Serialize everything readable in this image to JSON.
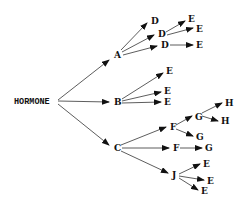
{
  "diagram": {
    "type": "tree",
    "colors": {
      "line": "#333333",
      "text": "#111111",
      "background": "#ffffff"
    },
    "nodes": [
      {
        "id": "hormone",
        "label": "HORMONE",
        "x": 14,
        "y": 104
      },
      {
        "id": "a",
        "label": "A",
        "x": 114,
        "y": 58
      },
      {
        "id": "b",
        "label": "B",
        "x": 114,
        "y": 105
      },
      {
        "id": "c",
        "label": "C",
        "x": 114,
        "y": 151
      },
      {
        "id": "a_d1",
        "label": "D",
        "x": 151,
        "y": 24
      },
      {
        "id": "a_d2",
        "label": "D",
        "x": 158,
        "y": 37
      },
      {
        "id": "a_d3",
        "label": "D",
        "x": 161,
        "y": 48
      },
      {
        "id": "d2_e1",
        "label": "E",
        "x": 188,
        "y": 22
      },
      {
        "id": "d2_e2",
        "label": "E",
        "x": 196,
        "y": 32
      },
      {
        "id": "d3_e",
        "label": "E",
        "x": 196,
        "y": 48
      },
      {
        "id": "b_e1",
        "label": "E",
        "x": 166,
        "y": 74
      },
      {
        "id": "b_e2",
        "label": "E",
        "x": 164,
        "y": 94
      },
      {
        "id": "b_e3",
        "label": "E",
        "x": 164,
        "y": 105
      },
      {
        "id": "c_f1",
        "label": "F",
        "x": 170,
        "y": 130
      },
      {
        "id": "f1_g1",
        "label": "G",
        "x": 195,
        "y": 120
      },
      {
        "id": "g1_h1",
        "label": "H",
        "x": 225,
        "y": 106
      },
      {
        "id": "g1_h2",
        "label": "H",
        "x": 221,
        "y": 124
      },
      {
        "id": "f1_g2",
        "label": "G",
        "x": 196,
        "y": 140
      },
      {
        "id": "c_f2",
        "label": "F",
        "x": 173,
        "y": 151
      },
      {
        "id": "f2_g",
        "label": "G",
        "x": 205,
        "y": 151
      },
      {
        "id": "c_j",
        "label": "J",
        "x": 172,
        "y": 178
      },
      {
        "id": "j_e1",
        "label": "E",
        "x": 203,
        "y": 167
      },
      {
        "id": "j_e2",
        "label": "E",
        "x": 207,
        "y": 184
      },
      {
        "id": "j_e3",
        "label": "E",
        "x": 201,
        "y": 194
      }
    ],
    "edges": [
      {
        "x1": 58,
        "y1": 100,
        "x2": 109,
        "y2": 60
      },
      {
        "x1": 58,
        "y1": 101,
        "x2": 109,
        "y2": 102
      },
      {
        "x1": 58,
        "y1": 104,
        "x2": 109,
        "y2": 145
      },
      {
        "x1": 121,
        "y1": 50,
        "x2": 147,
        "y2": 23
      },
      {
        "x1": 122,
        "y1": 52,
        "x2": 154,
        "y2": 35
      },
      {
        "x1": 123,
        "y1": 55,
        "x2": 157,
        "y2": 46
      },
      {
        "x1": 166,
        "y1": 32,
        "x2": 185,
        "y2": 21
      },
      {
        "x1": 167,
        "y1": 35,
        "x2": 193,
        "y2": 28
      },
      {
        "x1": 170,
        "y1": 45,
        "x2": 193,
        "y2": 45
      },
      {
        "x1": 122,
        "y1": 99,
        "x2": 163,
        "y2": 73
      },
      {
        "x1": 122,
        "y1": 101,
        "x2": 161,
        "y2": 92
      },
      {
        "x1": 122,
        "y1": 103,
        "x2": 161,
        "y2": 102
      },
      {
        "x1": 121,
        "y1": 145,
        "x2": 166,
        "y2": 127
      },
      {
        "x1": 122,
        "y1": 148,
        "x2": 169,
        "y2": 148
      },
      {
        "x1": 121,
        "y1": 151,
        "x2": 168,
        "y2": 173
      },
      {
        "x1": 176,
        "y1": 125,
        "x2": 192,
        "y2": 116
      },
      {
        "x1": 176,
        "y1": 129,
        "x2": 193,
        "y2": 136
      },
      {
        "x1": 202,
        "y1": 113,
        "x2": 222,
        "y2": 103
      },
      {
        "x1": 202,
        "y1": 116,
        "x2": 218,
        "y2": 121
      },
      {
        "x1": 180,
        "y1": 148,
        "x2": 202,
        "y2": 148
      },
      {
        "x1": 179,
        "y1": 174,
        "x2": 200,
        "y2": 164
      },
      {
        "x1": 179,
        "y1": 176,
        "x2": 204,
        "y2": 180
      },
      {
        "x1": 179,
        "y1": 178,
        "x2": 198,
        "y2": 190
      }
    ]
  }
}
